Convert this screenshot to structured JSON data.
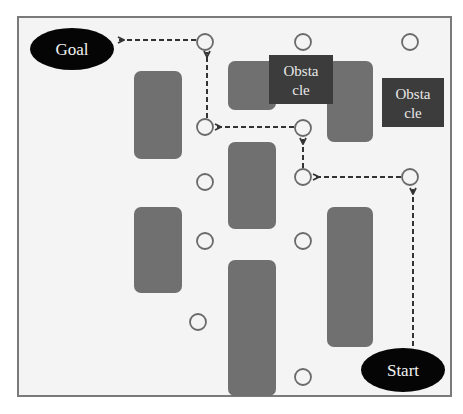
{
  "diagram": {
    "type": "path-planning-grid",
    "colors": {
      "background": "#ffffff",
      "field": "#f4f4f4",
      "border": "#7a7a7a",
      "obstacle_block": "#707070",
      "labeled_obstacle": "#3c3c3c",
      "terminal": "#050505",
      "terminal_text": "#f2f2f2",
      "node_stroke": "#6a6a6a",
      "arrow": "#333333"
    },
    "terminals": {
      "goal": {
        "label": "Goal",
        "cx": 72,
        "cy": 49,
        "rx": 42,
        "ry": 21
      },
      "start": {
        "label": "Start",
        "cx": 403,
        "cy": 370,
        "rx": 42,
        "ry": 22
      }
    },
    "labeled_obstacles": [
      {
        "line1": "Obsta",
        "line2": "cle",
        "x": 269,
        "y": 55,
        "w": 64,
        "h": 49
      },
      {
        "line1": "Obsta",
        "line2": "cle",
        "x": 382,
        "y": 78,
        "w": 62,
        "h": 49
      }
    ],
    "blocks": [
      {
        "x": 134,
        "y": 71,
        "w": 48,
        "h": 88
      },
      {
        "x": 228,
        "y": 61,
        "w": 48,
        "h": 49
      },
      {
        "x": 327,
        "y": 61,
        "w": 46,
        "h": 81
      },
      {
        "x": 228,
        "y": 142,
        "w": 48,
        "h": 87
      },
      {
        "x": 134,
        "y": 207,
        "w": 48,
        "h": 86
      },
      {
        "x": 327,
        "y": 207,
        "w": 46,
        "h": 140
      },
      {
        "x": 228,
        "y": 260,
        "w": 48,
        "h": 136
      }
    ],
    "nodes": [
      {
        "cx": 205,
        "cy": 42
      },
      {
        "cx": 303,
        "cy": 42
      },
      {
        "cx": 410,
        "cy": 42
      },
      {
        "cx": 205,
        "cy": 127
      },
      {
        "cx": 303,
        "cy": 128
      },
      {
        "cx": 205,
        "cy": 182
      },
      {
        "cx": 303,
        "cy": 177
      },
      {
        "cx": 410,
        "cy": 177
      },
      {
        "cx": 205,
        "cy": 241
      },
      {
        "cx": 303,
        "cy": 241
      },
      {
        "cx": 198,
        "cy": 322
      },
      {
        "cx": 303,
        "cy": 377
      }
    ],
    "path_arrows": [
      {
        "from": "start",
        "x1": 413,
        "y1": 346,
        "x2": 413,
        "y2": 189
      },
      {
        "from": "node(410,177)",
        "x1": 401,
        "y1": 177,
        "x2": 314,
        "y2": 177
      },
      {
        "from": "node(303,177)",
        "x1": 303,
        "y1": 168,
        "x2": 303,
        "y2": 139
      },
      {
        "from": "node(303,128)",
        "x1": 294,
        "y1": 127,
        "x2": 216,
        "y2": 127
      },
      {
        "from": "node(205,127)",
        "x1": 207,
        "y1": 118,
        "x2": 207,
        "y2": 52
      },
      {
        "from": "node(205,42)",
        "x1": 196,
        "y1": 40,
        "x2": 119,
        "y2": 40
      }
    ]
  }
}
